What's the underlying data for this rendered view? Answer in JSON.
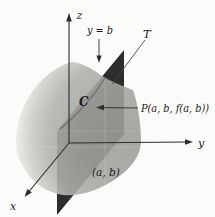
{
  "figure": {
    "type": "3d-surface-trace-diagram",
    "background": "#fbfbf9",
    "colors": {
      "surface_light": "#f3f4f0",
      "surface_mid": "#a3a5a0",
      "surface_dark": "#9a9c97",
      "cutting_plane": "#2d2d2b",
      "axis": "#2b2b2b",
      "label_text": "#1c1c1c"
    },
    "labels": {
      "z_axis": "z",
      "y_axis": "y",
      "x_axis": "x",
      "cutting_plane": "y = b",
      "tangent_line": "T",
      "trace_curve": "C",
      "surface_point": "P(a, b, f(a, b))",
      "domain_point": "(a, b)"
    }
  }
}
